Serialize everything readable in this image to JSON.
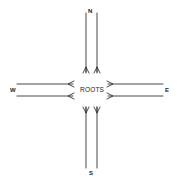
{
  "diagram": {
    "center_label": "ROOTS",
    "directions": {
      "north": "N",
      "south": "S",
      "east": "E",
      "west": "W"
    },
    "line_color": "#333333",
    "background": "#ffffff"
  }
}
